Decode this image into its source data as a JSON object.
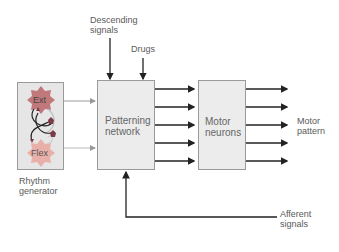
{
  "diagram": {
    "top_cut_text": "",
    "descending_signals": "Descending\nsignals",
    "descending_line1": "Descending",
    "descending_line2": "signals",
    "drugs": "Drugs",
    "rhythm_generator": {
      "ext": "Ext",
      "flex": "Flex",
      "label_line1": "Rhythm",
      "label_line2": "generator"
    },
    "patterning_network": {
      "line1": "Patterning",
      "line2": "network"
    },
    "motor_neurons": {
      "line1": "Motor",
      "line2": "neurons"
    },
    "motor_pattern": {
      "line1": "Motor",
      "line2": "pattern"
    },
    "afferent_signals": {
      "line1": "Afferent",
      "line2": "signals"
    },
    "colors": {
      "box_fill": "#ececec",
      "box_border": "#9a9a9a",
      "ext_cell": "#c0787a",
      "flex_cell": "#e8b0a8",
      "interneuron": "#7a3a48",
      "arrow": "#222222",
      "text": "#5a5a5a"
    }
  }
}
